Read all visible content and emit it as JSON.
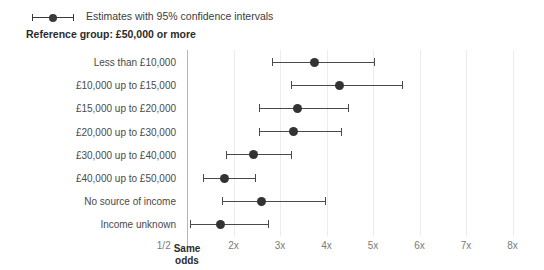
{
  "legend": {
    "label": "Estimates with 95% confidence intervals",
    "marker_icon": "point-range-icon"
  },
  "reference_group": "Reference group: £50,000 or more",
  "axis": {
    "same_odds_label_line1": "Same",
    "same_odds_label_line2": "odds",
    "half_tick": "1/2",
    "ticks": [
      "2x",
      "3x",
      "4x",
      "5x",
      "6x",
      "7x",
      "8x"
    ]
  },
  "colors": {
    "point": "#333333",
    "line": "#4a4a4a",
    "grid": "#ececec",
    "axis": "#b6b6b6",
    "text": "#4a4a4a",
    "background": "#ffffff"
  },
  "chart_data": {
    "type": "scatter",
    "title": "",
    "subtitle": "Reference group: £50,000 or more",
    "xlabel": "",
    "ylabel": "",
    "xlim": [
      0.5,
      8.5
    ],
    "xticks": [
      0.5,
      1,
      2,
      3,
      4,
      5,
      6,
      7,
      8
    ],
    "xticklabels": [
      "1/2",
      "Same odds",
      "2x",
      "3x",
      "4x",
      "5x",
      "6x",
      "7x",
      "8x"
    ],
    "grid": true,
    "legend": "Estimates with 95% confidence intervals",
    "legend_position": "top-left",
    "reference_line": 1,
    "categories": [
      "Less than £10,000",
      "£10,000 up to £15,000",
      "£15,000 up to £20,000",
      "£20,000 up to £30,000",
      "£30,000 up to £40,000",
      "£40,000 up to £50,000",
      "No source of income",
      "Income unknown"
    ],
    "estimates": [
      3.75,
      4.27,
      3.37,
      3.3,
      2.44,
      1.8,
      2.61,
      1.71
    ],
    "ci_lower": [
      2.83,
      3.24,
      2.55,
      2.55,
      1.84,
      1.34,
      1.75,
      1.06
    ],
    "ci_upper": [
      5.02,
      5.62,
      4.46,
      4.31,
      3.24,
      2.46,
      3.97,
      2.74
    ]
  }
}
